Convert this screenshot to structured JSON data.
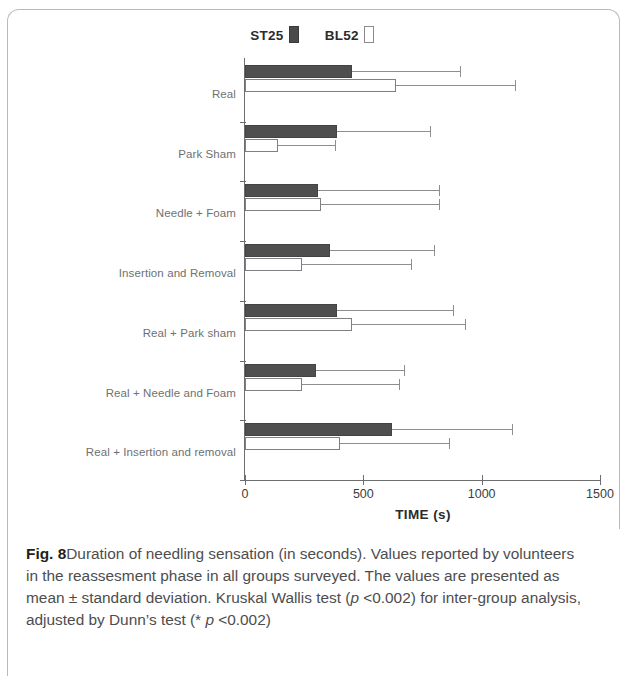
{
  "figure": {
    "label": "Fig. 8",
    "caption": "Duration of needling sensation (in seconds). Values reported by volunteers in the reassesment phase in all groups surveyed. The values are presented as mean ± standard deviation. Kruskal Wallis test (",
    "caption_p1": "p",
    "caption_mid": " <0.002) for inter-group analysis, adjusted by Dunn’s test (* ",
    "caption_p2": "p",
    "caption_end": " <0.002)"
  },
  "colors": {
    "st25_fill": "#4f4f4f",
    "bl52_fill": "#ffffff",
    "axis": "#6d6e70",
    "label": "#6f7073",
    "caption": "#4d4d4f"
  },
  "chart_data": {
    "type": "bar",
    "orientation": "horizontal",
    "title": "",
    "xlabel": "TIME (s)",
    "ylabel": "",
    "xlim": [
      0,
      1500
    ],
    "xticks": [
      0,
      500,
      1000,
      1500
    ],
    "xticklabels": [
      "0",
      "500",
      "1000",
      "1500"
    ],
    "grid": false,
    "legend_position": "top-center",
    "error_bars": "standard deviation (upper only shown)",
    "categories": [
      "Real",
      "Park Sham",
      "Needle + Foam",
      "Insertion and Removal",
      "Real + Park sham",
      "Real + Needle and Foam",
      "Real + Insertion and removal"
    ],
    "series": [
      {
        "name": "ST25",
        "swatch": "filled",
        "values": [
          450,
          390,
          310,
          360,
          390,
          300,
          620
        ],
        "errors": [
          460,
          390,
          510,
          440,
          490,
          370,
          510
        ]
      },
      {
        "name": "BL52",
        "swatch": "hollow",
        "values": [
          640,
          140,
          320,
          240,
          450,
          240,
          400
        ],
        "errors": [
          500,
          240,
          500,
          460,
          480,
          410,
          460
        ]
      }
    ]
  }
}
